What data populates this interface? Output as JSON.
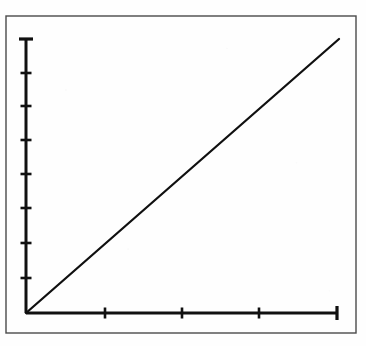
{
  "figure": {
    "kind": "scanned-line-plot",
    "background_color": "#fefefe",
    "ink_color": "#101010",
    "frame_color": "#4a4a4a",
    "frame": {
      "x": 6,
      "y": 16,
      "width": 350,
      "height": 317
    }
  },
  "chart_data": {
    "type": "line",
    "title": "",
    "subtitle": "",
    "xlabel": "",
    "ylabel": "",
    "legend": [],
    "legend_position": "none",
    "grid": false,
    "annotations": [],
    "xlim": [
      0,
      4
    ],
    "ylim": [
      0,
      8
    ],
    "x": [
      0,
      4
    ],
    "values": [
      0,
      8
    ],
    "series": [
      {
        "name": "",
        "x": [
          0,
          4
        ],
        "values": [
          0,
          8
        ],
        "style": "solid",
        "color": "#101010"
      }
    ],
    "x_ticks": [
      0,
      1,
      2,
      3,
      4
    ],
    "x_tick_labels": [
      "",
      "",
      "",
      "",
      ""
    ],
    "y_ticks": [
      0,
      1,
      2,
      3,
      4,
      5,
      6,
      7,
      8
    ],
    "y_tick_labels": [
      "",
      "",
      "",
      "",
      "",
      "",
      "",
      "",
      ""
    ],
    "axes_pixels": {
      "origin_x": 26,
      "origin_y": 313,
      "x_axis_end_x": 337,
      "y_axis_end_y": 39
    },
    "y_tick_pixels": [
      313,
      278,
      243,
      208,
      174,
      140,
      106,
      73,
      39
    ],
    "x_tick_pixels": [
      26,
      105,
      182,
      259,
      337
    ],
    "line_endpoints_pixels": {
      "x1": 26,
      "y1": 313,
      "x2": 339,
      "y2": 39
    }
  }
}
